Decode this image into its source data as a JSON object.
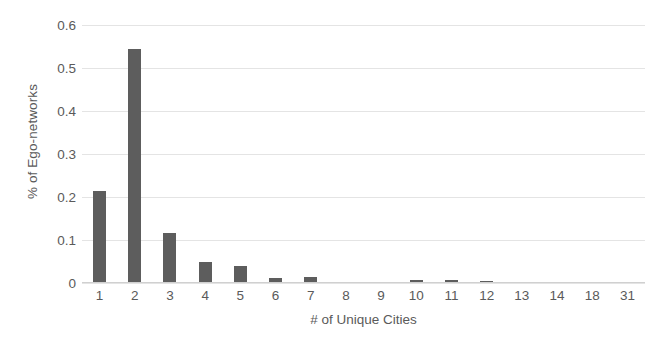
{
  "chart_data": {
    "type": "bar",
    "title": "",
    "subtitle": "",
    "xlabel": "# of Unique Cities",
    "ylabel": "% of Ego-networks",
    "categories": [
      "1",
      "2",
      "3",
      "4",
      "5",
      "6",
      "7",
      "8",
      "9",
      "10",
      "11",
      "12",
      "13",
      "14",
      "18",
      "31"
    ],
    "values": [
      0.213,
      0.545,
      0.116,
      0.048,
      0.04,
      0.011,
      0.015,
      0.002,
      0.002,
      0.006,
      0.006,
      0.005,
      0.002,
      0.002,
      0.001,
      0.001
    ],
    "ylim": [
      0,
      0.6
    ],
    "yticks": [
      0,
      0.1,
      0.2,
      0.3,
      0.4,
      0.5,
      0.6
    ],
    "ytick_labels": [
      "0",
      "0.1",
      "0.2",
      "0.3",
      "0.4",
      "0.5",
      "0.6"
    ],
    "grid": true,
    "grid_axis": "y",
    "legend": false,
    "legend_position": "none",
    "bar_color": "#5d5d5d",
    "grid_color": "#e4e4e4",
    "text_color": "#5a5a5a",
    "background_color": "#ffffff"
  }
}
